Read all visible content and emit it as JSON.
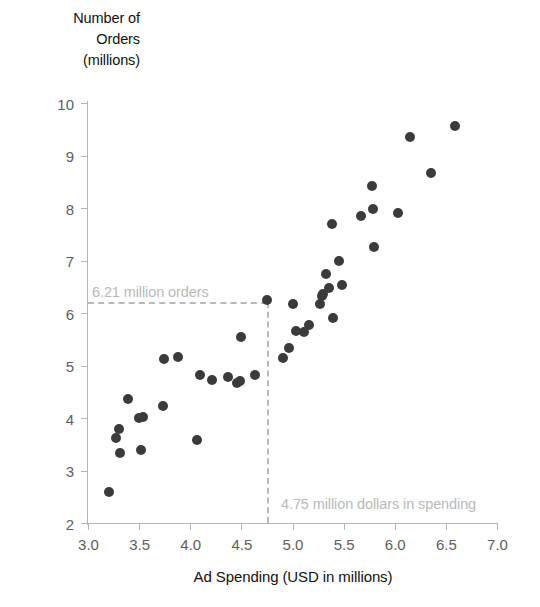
{
  "chart_data": {
    "type": "scatter",
    "title": "",
    "xlabel": "Ad Spending (USD in millions)",
    "ylabel": "Number of Orders (millions)",
    "ylabel_lines": [
      "Number of",
      "Orders",
      "(millions)"
    ],
    "xlim": [
      3.0,
      7.0
    ],
    "ylim": [
      2,
      10
    ],
    "xticks": [
      3.0,
      3.5,
      4.0,
      4.5,
      5.0,
      5.5,
      6.0,
      6.5,
      7.0
    ],
    "xtick_labels": [
      "3.0",
      "3.5",
      "4.0",
      "4.5",
      "5.0",
      "5.5",
      "6.0",
      "6.5",
      "7.0"
    ],
    "yticks": [
      2,
      3,
      4,
      5,
      6,
      7,
      8,
      9,
      10
    ],
    "ytick_labels": [
      "2",
      "3",
      "4",
      "5",
      "6",
      "7",
      "8",
      "9",
      "10"
    ],
    "grid": false,
    "legend": null,
    "marker_color": "#3b3b3b",
    "axis_color": "#b4b4b4",
    "annotation_color": "#b9b9b9",
    "points": [
      [
        3.21,
        2.59
      ],
      [
        3.27,
        3.62
      ],
      [
        3.3,
        3.79
      ],
      [
        3.31,
        3.34
      ],
      [
        3.39,
        4.37
      ],
      [
        3.5,
        4.0
      ],
      [
        3.54,
        4.01
      ],
      [
        3.52,
        3.4
      ],
      [
        3.74,
        5.12
      ],
      [
        3.73,
        4.22
      ],
      [
        3.88,
        5.17
      ],
      [
        4.07,
        3.59
      ],
      [
        4.1,
        4.82
      ],
      [
        4.21,
        4.73
      ],
      [
        4.37,
        4.79
      ],
      [
        4.46,
        4.66
      ],
      [
        4.49,
        4.7
      ],
      [
        4.5,
        5.55
      ],
      [
        4.63,
        4.81
      ],
      [
        4.75,
        6.25
      ],
      [
        4.91,
        5.15
      ],
      [
        4.97,
        5.33
      ],
      [
        5.0,
        6.17
      ],
      [
        5.03,
        5.66
      ],
      [
        5.11,
        5.63
      ],
      [
        5.16,
        5.78
      ],
      [
        5.27,
        6.17
      ],
      [
        5.29,
        6.32
      ],
      [
        5.3,
        6.37
      ],
      [
        5.33,
        6.75
      ],
      [
        5.36,
        6.48
      ],
      [
        5.39,
        7.7
      ],
      [
        5.4,
        5.91
      ],
      [
        5.45,
        7.0
      ],
      [
        5.48,
        6.53
      ],
      [
        5.67,
        7.84
      ],
      [
        5.78,
        8.41
      ],
      [
        5.79,
        7.98
      ],
      [
        5.8,
        7.25
      ],
      [
        6.03,
        7.9
      ],
      [
        6.15,
        9.35
      ],
      [
        6.35,
        8.67
      ],
      [
        6.59,
        9.56
      ]
    ],
    "annotations": [
      {
        "name": "orders-guide",
        "orientation": "horizontal",
        "value": 6.21,
        "label": "6.21 million orders",
        "from_x": 3.0,
        "to_x": 4.75
      },
      {
        "name": "spending-guide",
        "orientation": "vertical",
        "value": 4.75,
        "label": "4.75 million dollars in spending",
        "from_y": 2,
        "to_y": 6.21
      }
    ]
  }
}
